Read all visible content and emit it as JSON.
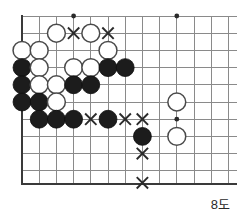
{
  "caption": "8도",
  "board": {
    "label": "go-board-diagram",
    "cols": 13,
    "rows": 10,
    "origin_x": 22,
    "origin_y": 16,
    "spacing": 17.2,
    "bottom_edge_y": 184,
    "right_edge_x": 237,
    "colors": {
      "grid": "#8a8a8a",
      "edge": "#3a3a3a",
      "black_stone": "#1c1c1c",
      "white_stone": "#ffffff",
      "white_stone_outline": "#4a4a4a",
      "mark": "#2a2a2a",
      "background": "#ffffff"
    },
    "star_points": [
      {
        "col": 3,
        "row": 0
      },
      {
        "col": 9,
        "row": 0
      },
      {
        "col": 9,
        "row": 6
      }
    ],
    "stones": [
      {
        "color": "white",
        "col": 2,
        "row": 1
      },
      {
        "color": "white",
        "col": 4,
        "row": 1
      },
      {
        "color": "white",
        "col": 0,
        "row": 2
      },
      {
        "color": "white",
        "col": 1,
        "row": 2
      },
      {
        "color": "white",
        "col": 5,
        "row": 2
      },
      {
        "color": "black",
        "col": 0,
        "row": 3
      },
      {
        "color": "white",
        "col": 1,
        "row": 3
      },
      {
        "color": "white",
        "col": 3,
        "row": 3
      },
      {
        "color": "white",
        "col": 4,
        "row": 3
      },
      {
        "color": "black",
        "col": 5,
        "row": 3
      },
      {
        "color": "black",
        "col": 6,
        "row": 3
      },
      {
        "color": "black",
        "col": 0,
        "row": 4
      },
      {
        "color": "white",
        "col": 1,
        "row": 4
      },
      {
        "color": "white",
        "col": 2,
        "row": 4
      },
      {
        "color": "black",
        "col": 3,
        "row": 4
      },
      {
        "color": "black",
        "col": 4,
        "row": 4
      },
      {
        "color": "black",
        "col": 0,
        "row": 5
      },
      {
        "color": "black",
        "col": 1,
        "row": 5
      },
      {
        "color": "white",
        "col": 2,
        "row": 5
      },
      {
        "color": "white",
        "col": 9,
        "row": 5
      },
      {
        "color": "black",
        "col": 1,
        "row": 6
      },
      {
        "color": "black",
        "col": 2,
        "row": 6
      },
      {
        "color": "black",
        "col": 3,
        "row": 6
      },
      {
        "color": "black",
        "col": 5,
        "row": 6
      },
      {
        "color": "black",
        "col": 7,
        "row": 7
      },
      {
        "color": "white",
        "col": 9,
        "row": 7
      }
    ],
    "marks": [
      {
        "type": "x",
        "col": 3,
        "row": 1
      },
      {
        "type": "x",
        "col": 5,
        "row": 1
      },
      {
        "type": "x",
        "col": 4,
        "row": 6
      },
      {
        "type": "x",
        "col": 6,
        "row": 6
      },
      {
        "type": "x",
        "col": 7,
        "row": 6
      },
      {
        "type": "x",
        "col": 7,
        "row": 8
      },
      {
        "type": "x",
        "col": 7,
        "row": 9.7
      }
    ]
  }
}
